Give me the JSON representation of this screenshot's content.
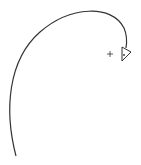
{
  "diagram": {
    "stroke_color": "#333333",
    "background": "#ffffff",
    "curve": {
      "path": "M16,156 C4,110 8,60 40,32 C70,6 112,4 124,28 C127,35 127,42 126,48"
    },
    "arrowhead": {
      "points": "122,47 131,52 122,61",
      "fill": "#ffffff"
    },
    "arrow_dot": {
      "cx": 124,
      "cy": 55,
      "r": 0.9
    },
    "crosshair": {
      "x": 110,
      "y": 54,
      "size": 3
    }
  }
}
